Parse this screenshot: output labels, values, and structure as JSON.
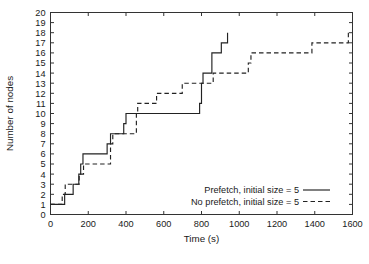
{
  "chart_data": {
    "type": "line",
    "title": "",
    "xlabel": "Time (s)",
    "ylabel": "Number of nodes",
    "xlim": [
      0,
      1600
    ],
    "ylim": [
      0,
      20
    ],
    "xticks": [
      0,
      200,
      400,
      600,
      800,
      1000,
      1200,
      1400,
      1600
    ],
    "yticks": [
      0,
      1,
      2,
      3,
      4,
      5,
      6,
      7,
      8,
      9,
      10,
      11,
      12,
      13,
      14,
      15,
      16,
      17,
      18,
      19,
      20
    ],
    "grid": false,
    "step_style": "post",
    "legend_position": "lower-right-inside",
    "series": [
      {
        "name": "Prefetch, initial size = 5",
        "style": "solid",
        "color": "#222222",
        "points": [
          [
            0,
            1
          ],
          [
            75,
            1
          ],
          [
            75,
            2
          ],
          [
            120,
            2
          ],
          [
            120,
            3
          ],
          [
            150,
            3
          ],
          [
            150,
            4
          ],
          [
            160,
            4
          ],
          [
            160,
            5
          ],
          [
            172,
            5
          ],
          [
            172,
            6
          ],
          [
            300,
            6
          ],
          [
            300,
            7
          ],
          [
            318,
            7
          ],
          [
            318,
            8
          ],
          [
            388,
            8
          ],
          [
            388,
            9
          ],
          [
            400,
            9
          ],
          [
            400,
            10
          ],
          [
            790,
            10
          ],
          [
            790,
            11
          ],
          [
            800,
            11
          ],
          [
            800,
            13
          ],
          [
            808,
            13
          ],
          [
            808,
            14
          ],
          [
            855,
            14
          ],
          [
            855,
            16
          ],
          [
            905,
            16
          ],
          [
            905,
            17
          ],
          [
            938,
            17
          ],
          [
            938,
            18
          ]
        ]
      },
      {
        "name": "No prefetch, initial size = 5",
        "style": "dashed",
        "color": "#222222",
        "points": [
          [
            0,
            1
          ],
          [
            62,
            1
          ],
          [
            62,
            2
          ],
          [
            78,
            2
          ],
          [
            78,
            3
          ],
          [
            152,
            3
          ],
          [
            152,
            4
          ],
          [
            175,
            4
          ],
          [
            175,
            5
          ],
          [
            318,
            5
          ],
          [
            318,
            7
          ],
          [
            330,
            7
          ],
          [
            330,
            8
          ],
          [
            455,
            8
          ],
          [
            455,
            10
          ],
          [
            462,
            10
          ],
          [
            462,
            11
          ],
          [
            562,
            11
          ],
          [
            562,
            12
          ],
          [
            698,
            12
          ],
          [
            698,
            13
          ],
          [
            862,
            13
          ],
          [
            862,
            14
          ],
          [
            1048,
            14
          ],
          [
            1048,
            15
          ],
          [
            1062,
            15
          ],
          [
            1062,
            16
          ],
          [
            1385,
            16
          ],
          [
            1385,
            17
          ],
          [
            1578,
            17
          ],
          [
            1578,
            18
          ]
        ]
      }
    ]
  },
  "legend": {
    "entries": [
      {
        "label": "Prefetch, initial size = 5",
        "style": "solid"
      },
      {
        "label": "No prefetch, initial size = 5",
        "style": "dashed"
      }
    ]
  },
  "caption": {
    "text": ""
  }
}
